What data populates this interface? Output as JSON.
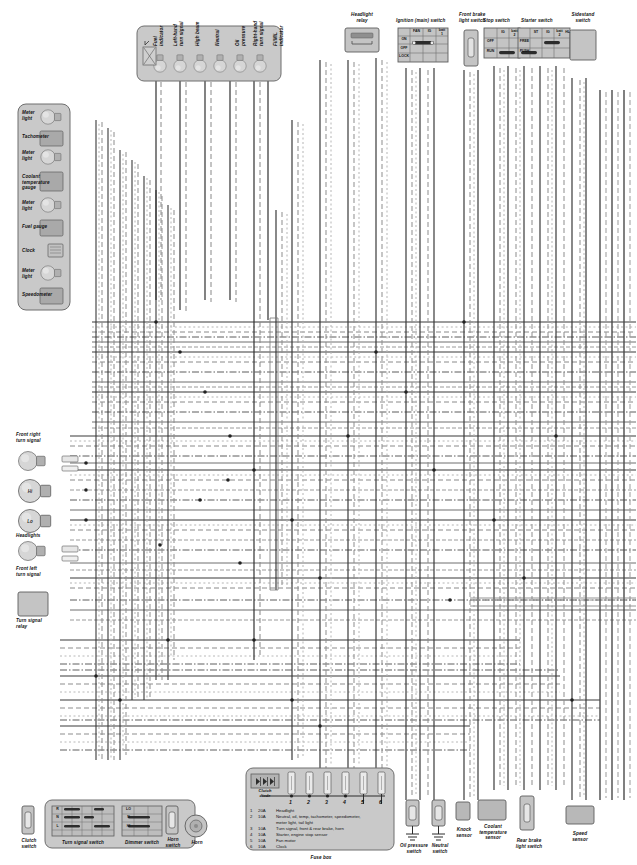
{
  "diagram": {
    "colors": {
      "panel_fill": "#c9c9c9",
      "panel_stroke": "#6e6e6e",
      "component_fill": "#b4b4b4",
      "bulb_fill": "#d4d4d4",
      "wire_dark": "#2b2b2b",
      "wire_mid": "#6d6d6d",
      "wire_light": "#a8a8a8",
      "background": "#ffffff"
    }
  },
  "indicator_panel": {
    "name": "indicator-panel",
    "indicators": [
      {
        "label": "Fuel\nindicator"
      },
      {
        "label": "Left-hand\nturn signal"
      },
      {
        "label": "High beam"
      },
      {
        "label": "Neutral"
      },
      {
        "label": "Oil\npressure"
      },
      {
        "label": "Right-hand\nturn signal"
      },
      {
        "label": "FI/MIL\nindicator"
      }
    ]
  },
  "meter_panel": {
    "name": "meter-panel",
    "items": [
      {
        "label": "Meter\nlight",
        "type": "bulb"
      },
      {
        "label": "Tachometer",
        "type": "box"
      },
      {
        "label": "Meter\nlight",
        "type": "bulb"
      },
      {
        "label": "Coolant\ntemperature\ngauge",
        "type": "box"
      },
      {
        "label": "Meter\nlight",
        "type": "bulb"
      },
      {
        "label": "Fuel gauge",
        "type": "box"
      },
      {
        "label": "Clock",
        "type": "lcd"
      },
      {
        "label": "Meter\nlight",
        "type": "bulb"
      },
      {
        "label": "Speedometer",
        "type": "box"
      }
    ]
  },
  "top_components": {
    "headlight_relay": {
      "label": "Headlight\nrelay"
    },
    "ignition_switch": {
      "label": "Ignition (main) switch",
      "columns": [
        "FAN",
        "IG",
        "batt\n1"
      ],
      "rows": [
        "ON",
        "OFF",
        "LOCK"
      ]
    },
    "front_brake_light_switch": {
      "label": "Front brake\nlight switch"
    },
    "stop_switch": {
      "label": "Stop switch",
      "columns": [
        "IG",
        "batt\n2"
      ],
      "rows": [
        "OFF",
        "RUN"
      ]
    },
    "starter_switch": {
      "label": "Starter switch",
      "columns": [
        "ST",
        "IG",
        "batt\n2",
        "HL"
      ],
      "rows": [
        "FREE",
        "PUSH"
      ]
    },
    "sidestand_switch": {
      "label": "Sidestand\nswitch"
    }
  },
  "left_lamps": {
    "front_right_turn_signal": {
      "label": "Front right\nturn signal"
    },
    "headlights": {
      "label": "Headlights",
      "hi_label": "Hi",
      "lo_label": "Lo"
    },
    "front_left_turn_signal": {
      "label": "Front left\nturn signal"
    },
    "turn_signal_relay": {
      "label": "Turn signal\nrelay"
    }
  },
  "bottom_left": {
    "clutch_switch": {
      "label": "Clutch\nswitch"
    },
    "turn_signal_switch": {
      "label": "Turn signal switch",
      "rows": [
        "R",
        "N",
        "L"
      ],
      "columns": [
        "TR",
        "FR",
        "RL",
        "W",
        "R",
        "L"
      ]
    },
    "dimmer_switch": {
      "label": "Dimmer switch",
      "rows": [
        "LO",
        "N",
        "HI"
      ],
      "columns": [
        "HL",
        "LO",
        "HI"
      ]
    },
    "horn_switch": {
      "label": "Horn\nswitch"
    },
    "horn": {
      "label": "Horn"
    }
  },
  "fuse_box": {
    "label": "Fuse box",
    "clutch_diode": {
      "label": "Clutch\ndiode"
    },
    "numbers": [
      "1",
      "2",
      "3",
      "4",
      "5",
      "6"
    ],
    "legend": [
      {
        "no": "1",
        "rating": "20A",
        "desc": "Headlight"
      },
      {
        "no": "2",
        "rating": "10A",
        "desc": "Neutral, oil, temp, tachometer, speedometer,\nmeter light, tail light"
      },
      {
        "no": "3",
        "rating": "10A",
        "desc": "Turn signal, front & rear brake, horn"
      },
      {
        "no": "4",
        "rating": "10A",
        "desc": "Starter, engine stop sensor"
      },
      {
        "no": "5",
        "rating": "10A",
        "desc": "Fan motor"
      },
      {
        "no": "6",
        "rating": "10A",
        "desc": "Clock"
      }
    ]
  },
  "bottom_right": {
    "oil_pressure_switch": {
      "label": "Oil pressure\nswitch"
    },
    "neutral_switch": {
      "label": "Neutral\nswitch"
    },
    "knock_sensor": {
      "label": "Knock\nsensor"
    },
    "coolant_temperature_sensor": {
      "label": "Coolant\ntemperature\nsensor"
    },
    "rear_brake_light_switch": {
      "label": "Rear brake\nlight switch"
    },
    "speed_sensor": {
      "label": "Speed\nsensor"
    }
  }
}
